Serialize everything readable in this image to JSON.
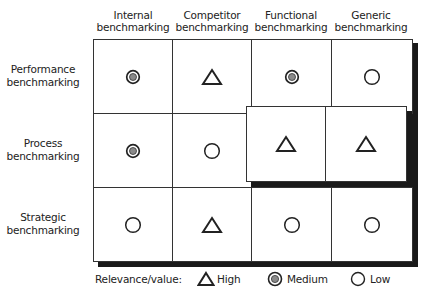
{
  "columns": [
    "Internal\nbenchmarking",
    "Competitor\nbenchmarking",
    "Functional\nbenchmarking",
    "Generic\nbenchmarking"
  ],
  "column_lines": [
    [
      "Internal",
      "benchmarking"
    ],
    [
      "Competitor",
      "benchmarking"
    ],
    [
      "Functional",
      "benchmarking"
    ],
    [
      "Generic",
      "benchmarking"
    ]
  ],
  "rows": [
    {
      "lines": [
        "Performance",
        "benchmarking"
      ],
      "cells": [
        "medium",
        "high",
        "medium",
        "low"
      ]
    },
    {
      "lines": [
        "Process",
        "benchmarking"
      ],
      "cells": [
        "medium",
        "low",
        "high",
        "high"
      ]
    },
    {
      "lines": [
        "Strategic",
        "benchmarking"
      ],
      "cells": [
        "low",
        "high",
        "low",
        "low"
      ]
    }
  ],
  "highlighted_cells": [
    [
      1,
      2
    ],
    [
      1,
      3
    ]
  ],
  "legend": {
    "title": "Relevance/value:",
    "items": [
      {
        "symbol": "triangle-icon",
        "label": "High"
      },
      {
        "symbol": "double-circle-icon",
        "label": "Medium"
      },
      {
        "symbol": "circle-icon",
        "label": "Low"
      }
    ]
  },
  "colors": {
    "line": "#333333",
    "shadow": "#1a1a1a",
    "medium_fill": "#8a8a8a"
  }
}
